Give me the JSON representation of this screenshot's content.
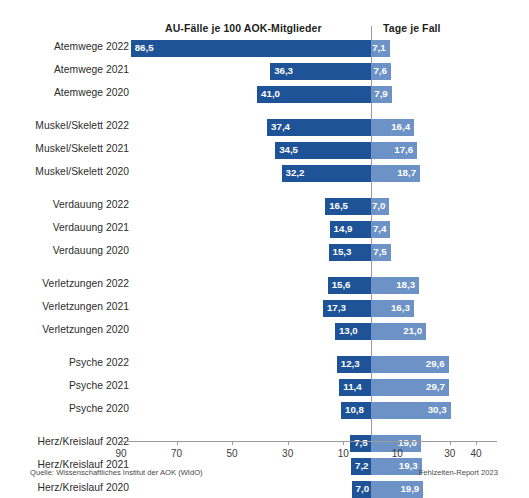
{
  "headers": {
    "left_title": "AU-Fälle je 100 AOK-Mitglieder",
    "right_title": "Tage je Fall"
  },
  "footer": {
    "source": "Quelle: Wissenschaftliches Institut der AOK (WIdO)",
    "report": "Fehlzeiten-Report 2023"
  },
  "colors": {
    "bar_left": "#1e5398",
    "bar_right": "#6d92c6",
    "axis": "#9a9a9a",
    "text": "#2b2b2b"
  },
  "chart_data": {
    "type": "bar",
    "title": "",
    "subtitle": "",
    "orientation": "horizontal-diverging",
    "xlabel": "",
    "ylabel": "",
    "grid": false,
    "legend": null,
    "axis": {
      "left_label": "AU-Fälle je 100 AOK-Mitglieder",
      "right_label": "Tage je Fall",
      "left_ticks": [
        90,
        70,
        50,
        30,
        10
      ],
      "right_ticks": [
        10,
        30,
        40
      ],
      "left_max": 90,
      "right_max": 40,
      "tick_labels": [
        "90",
        "70",
        "50",
        "30",
        "10",
        "10",
        "30",
        "40"
      ]
    },
    "categories": [
      "Atemwege 2022",
      "Atemwege 2021",
      "Atemwege 2020",
      "Muskel/Skelett 2022",
      "Muskel/Skelett 2021",
      "Muskel/Skelett 2020",
      "Verdauung 2022",
      "Verdauung 2021",
      "Verdauung 2020",
      "Verletzungen 2022",
      "Verletzungen 2021",
      "Verletzungen 2020",
      "Psyche 2022",
      "Psyche 2021",
      "Psyche 2020",
      "Herz/Kreislauf 2022",
      "Herz/Kreislauf 2021",
      "Herz/Kreislauf 2020"
    ],
    "series": [
      {
        "name": "AU-Fälle je 100 AOK-Mitglieder",
        "side": "left",
        "values": [
          86.5,
          36.3,
          41.0,
          37.4,
          34.5,
          32.2,
          16.5,
          14.9,
          15.3,
          15.6,
          17.3,
          13.0,
          12.3,
          11.4,
          10.8,
          7.5,
          7.2,
          7.0
        ],
        "labels": [
          "86,5",
          "36,3",
          "41,0",
          "37,4",
          "34,5",
          "32,2",
          "16,5",
          "14,9",
          "15,3",
          "15,6",
          "17,3",
          "13,0",
          "12,3",
          "11,4",
          "10,8",
          "7,5",
          "7,2",
          "7,0"
        ]
      },
      {
        "name": "Tage je Fall",
        "side": "right",
        "values": [
          7.1,
          7.6,
          7.9,
          16.4,
          17.6,
          18.7,
          7.0,
          7.4,
          7.5,
          18.3,
          16.3,
          21.0,
          29.6,
          29.7,
          30.3,
          19.0,
          19.3,
          19.9
        ],
        "labels": [
          "7,1",
          "7,6",
          "7,9",
          "16,4",
          "17,6",
          "18,7",
          "7,0",
          "7,4",
          "7,5",
          "18,3",
          "16,3",
          "21,0",
          "29,6",
          "29,7",
          "30,3",
          "19,0",
          "19,3",
          "19,9"
        ]
      }
    ],
    "groups": [
      {
        "name": "Atemwege",
        "rows": [
          0,
          1,
          2
        ]
      },
      {
        "name": "Muskel/Skelett",
        "rows": [
          3,
          4,
          5
        ]
      },
      {
        "name": "Verdauung",
        "rows": [
          6,
          7,
          8
        ]
      },
      {
        "name": "Verletzungen",
        "rows": [
          9,
          10,
          11
        ]
      },
      {
        "name": "Psyche",
        "rows": [
          12,
          13,
          14
        ]
      },
      {
        "name": "Herz/Kreislauf",
        "rows": [
          15,
          16,
          17
        ]
      }
    ]
  }
}
